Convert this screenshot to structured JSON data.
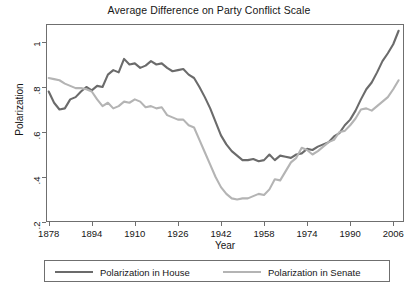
{
  "chart_data": {
    "type": "line",
    "title": "Average Difference on Party Conflict Scale",
    "xlabel": "Year",
    "ylabel": "Polarization",
    "xlim": [
      1877,
      2010
    ],
    "ylim": [
      0.2,
      1.08
    ],
    "grid": false,
    "legend_position": "bottom",
    "xticks": [
      "1878",
      "1894",
      "1910",
      "1926",
      "1942",
      "1958",
      "1974",
      "1990",
      "2006"
    ],
    "xtick_values": [
      1878,
      1894,
      1910,
      1926,
      1942,
      1958,
      1974,
      1990,
      2006
    ],
    "yticks": [
      "1",
      ".8",
      ".6",
      ".4",
      ".2"
    ],
    "ytick_values": [
      1,
      0.8,
      0.6,
      0.4,
      0.2
    ],
    "x": [
      1878,
      1880,
      1882,
      1884,
      1886,
      1888,
      1890,
      1892,
      1894,
      1896,
      1898,
      1900,
      1902,
      1904,
      1906,
      1908,
      1910,
      1912,
      1914,
      1916,
      1918,
      1920,
      1922,
      1924,
      1926,
      1928,
      1930,
      1932,
      1934,
      1936,
      1938,
      1940,
      1942,
      1944,
      1946,
      1948,
      1950,
      1952,
      1954,
      1956,
      1958,
      1960,
      1962,
      1964,
      1966,
      1968,
      1970,
      1972,
      1974,
      1976,
      1978,
      1980,
      1982,
      1984,
      1986,
      1988,
      1990,
      1992,
      1994,
      1996,
      1998,
      2000,
      2002,
      2004,
      2006,
      2008
    ],
    "series": [
      {
        "name": "Polarization in House",
        "color": "#6b6b6b",
        "values": [
          0.78,
          0.73,
          0.7,
          0.705,
          0.745,
          0.755,
          0.78,
          0.8,
          0.785,
          0.805,
          0.8,
          0.855,
          0.875,
          0.865,
          0.925,
          0.9,
          0.905,
          0.885,
          0.895,
          0.915,
          0.9,
          0.905,
          0.885,
          0.87,
          0.875,
          0.88,
          0.855,
          0.84,
          0.8,
          0.755,
          0.705,
          0.645,
          0.585,
          0.545,
          0.515,
          0.495,
          0.475,
          0.475,
          0.48,
          0.47,
          0.475,
          0.5,
          0.475,
          0.495,
          0.49,
          0.485,
          0.5,
          0.505,
          0.525,
          0.52,
          0.535,
          0.545,
          0.555,
          0.58,
          0.595,
          0.63,
          0.655,
          0.695,
          0.745,
          0.79,
          0.82,
          0.865,
          0.915,
          0.95,
          0.99,
          1.05
        ]
      },
      {
        "name": "Polarization in Senate",
        "color": "#b4b4b4",
        "values": [
          0.84,
          0.835,
          0.83,
          0.815,
          0.805,
          0.795,
          0.795,
          0.79,
          0.78,
          0.745,
          0.715,
          0.73,
          0.705,
          0.715,
          0.735,
          0.73,
          0.745,
          0.735,
          0.71,
          0.715,
          0.705,
          0.71,
          0.675,
          0.665,
          0.655,
          0.655,
          0.63,
          0.62,
          0.565,
          0.51,
          0.455,
          0.4,
          0.355,
          0.325,
          0.305,
          0.3,
          0.305,
          0.305,
          0.315,
          0.325,
          0.32,
          0.345,
          0.39,
          0.385,
          0.425,
          0.465,
          0.485,
          0.53,
          0.52,
          0.5,
          0.515,
          0.535,
          0.555,
          0.565,
          0.6,
          0.605,
          0.63,
          0.66,
          0.7,
          0.705,
          0.695,
          0.715,
          0.735,
          0.755,
          0.79,
          0.83
        ]
      }
    ]
  }
}
